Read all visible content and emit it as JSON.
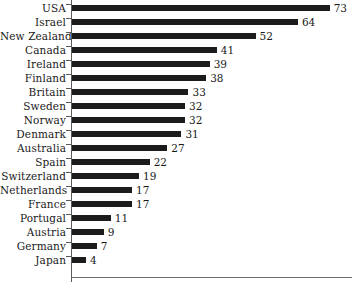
{
  "chart_data": {
    "type": "bar",
    "orientation": "horizontal",
    "title": "",
    "subtitle": "",
    "xlabel": "",
    "ylabel": "",
    "xlim": [
      0,
      80
    ],
    "grid": false,
    "legend": null,
    "value_labels": true,
    "categories": [
      "USA",
      "Israel",
      "New Zealand",
      "Canada",
      "Ireland",
      "Finland",
      "Britain",
      "Sweden",
      "Norway",
      "Denmark",
      "Australia",
      "Spain",
      "Switzerland",
      "Netherlands",
      "France",
      "Portugal",
      "Austria",
      "Germany",
      "Japan"
    ],
    "values": [
      73,
      64,
      52,
      41,
      39,
      38,
      33,
      32,
      32,
      31,
      27,
      22,
      19,
      17,
      17,
      11,
      9,
      7,
      4
    ],
    "value_labels_text": [
      "73",
      "64",
      "52",
      "41",
      "39",
      "38",
      "33",
      "32",
      "32",
      "31",
      "27",
      "22",
      "19",
      "17",
      "17",
      "11",
      "9",
      "7",
      "4"
    ],
    "colors": {
      "bar": "#1c1c1c",
      "axis": "#5a5a5a",
      "text": "#1a1a1a",
      "background": "#ffffff"
    }
  }
}
